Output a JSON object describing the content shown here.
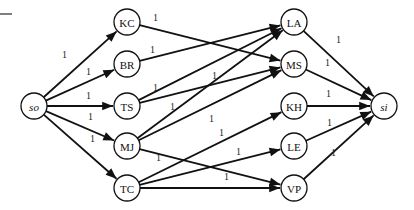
{
  "diagram": {
    "type": "flow-network",
    "nodes": [
      {
        "id": "so",
        "label": "so",
        "x": 34,
        "y": 106,
        "italic": true
      },
      {
        "id": "KC",
        "label": "KC",
        "x": 127,
        "y": 22
      },
      {
        "id": "BR",
        "label": "BR",
        "x": 127,
        "y": 64
      },
      {
        "id": "TS",
        "label": "TS",
        "x": 127,
        "y": 106
      },
      {
        "id": "MJ",
        "label": "MJ",
        "x": 127,
        "y": 146
      },
      {
        "id": "TC",
        "label": "TC",
        "x": 127,
        "y": 188
      },
      {
        "id": "LA",
        "label": "LA",
        "x": 294,
        "y": 22
      },
      {
        "id": "MS",
        "label": "MS",
        "x": 294,
        "y": 64
      },
      {
        "id": "KH",
        "label": "KH",
        "x": 294,
        "y": 106
      },
      {
        "id": "LE",
        "label": "LE",
        "x": 294,
        "y": 146
      },
      {
        "id": "VP",
        "label": "VP",
        "x": 294,
        "y": 188
      },
      {
        "id": "si",
        "label": "si",
        "x": 384,
        "y": 106,
        "italic": true
      }
    ],
    "edges": [
      {
        "from": "so",
        "to": "KC",
        "weight": "1",
        "lx": 62,
        "ly": 58
      },
      {
        "from": "so",
        "to": "BR",
        "weight": "1",
        "lx": 86,
        "ly": 75
      },
      {
        "from": "so",
        "to": "TS",
        "weight": "1",
        "lx": 86,
        "ly": 99
      },
      {
        "from": "so",
        "to": "MJ",
        "weight": "1",
        "lx": 88,
        "ly": 120
      },
      {
        "from": "so",
        "to": "TC",
        "weight": "1",
        "lx": 90,
        "ly": 142
      },
      {
        "from": "KC",
        "to": "MS",
        "weight": "1",
        "lx": 153,
        "ly": 21
      },
      {
        "from": "BR",
        "to": "LA",
        "weight": "1",
        "lx": 150,
        "ly": 53
      },
      {
        "from": "TS",
        "to": "LA",
        "weight": "1",
        "lx": 153,
        "ly": 91
      },
      {
        "from": "TS",
        "to": "MS",
        "weight": "1",
        "lx": 212,
        "ly": 79
      },
      {
        "from": "MJ",
        "to": "LA",
        "weight": "1",
        "lx": 170,
        "ly": 110
      },
      {
        "from": "MJ",
        "to": "MS",
        "weight": "1",
        "lx": 209,
        "ly": 122
      },
      {
        "from": "MJ",
        "to": "VP",
        "weight": "1",
        "lx": 156,
        "ly": 161
      },
      {
        "from": "TC",
        "to": "KH",
        "weight": "1",
        "lx": 219,
        "ly": 136
      },
      {
        "from": "TC",
        "to": "LE",
        "weight": "1",
        "lx": 236,
        "ly": 155
      },
      {
        "from": "TC",
        "to": "VP",
        "weight": "1",
        "lx": 224,
        "ly": 180
      },
      {
        "from": "LA",
        "to": "si",
        "weight": "1",
        "lx": 336,
        "ly": 43
      },
      {
        "from": "MS",
        "to": "si",
        "weight": "1",
        "lx": 325,
        "ly": 66
      },
      {
        "from": "KH",
        "to": "si",
        "weight": "1",
        "lx": 326,
        "ly": 97
      },
      {
        "from": "LE",
        "to": "si",
        "weight": "1",
        "lx": 327,
        "ly": 126
      },
      {
        "from": "VP",
        "to": "si",
        "weight": "1",
        "lx": 331,
        "ly": 156
      }
    ]
  },
  "colors": {
    "line": "#111111",
    "background": "#ffffff"
  }
}
